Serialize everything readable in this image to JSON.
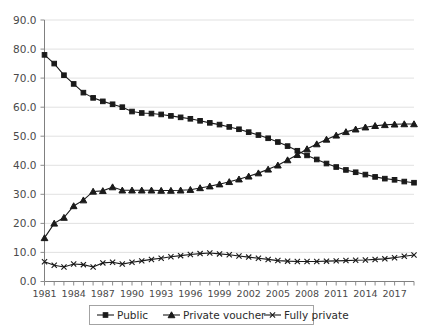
{
  "chart_data": {
    "type": "line",
    "title": "",
    "subtitle": "",
    "xlabel": "",
    "ylabel": "",
    "grid": "horizontal",
    "legend_position": "bottom-center",
    "xlim": [
      1981,
      2019
    ],
    "ylim": [
      0.0,
      90.0
    ],
    "ytick_step": 10.0,
    "xtick_step_labeled": 3,
    "x": [
      1981,
      1982,
      1983,
      1984,
      1985,
      1986,
      1987,
      1988,
      1989,
      1990,
      1991,
      1992,
      1993,
      1994,
      1995,
      1996,
      1997,
      1998,
      1999,
      2000,
      2001,
      2002,
      2003,
      2004,
      2005,
      2006,
      2007,
      2008,
      2009,
      2010,
      2011,
      2012,
      2013,
      2014,
      2015,
      2016,
      2017,
      2018,
      2019
    ],
    "xticklabels": [
      "1981",
      "1984",
      "1987",
      "1990",
      "1993",
      "1996",
      "1999",
      "2002",
      "2005",
      "2008",
      "2011",
      "2014",
      "2017"
    ],
    "yticklabels": [
      "0.0",
      "10.0",
      "20.0",
      "30.0",
      "40.0",
      "50.0",
      "60.0",
      "70.0",
      "80.0",
      "90.0"
    ],
    "series": [
      {
        "name": "Public",
        "marker": "square",
        "color": "#1a1a1a",
        "values": [
          78.0,
          75.0,
          71.0,
          68.0,
          65.0,
          63.2,
          62.0,
          61.0,
          60.0,
          58.5,
          58.0,
          57.8,
          57.5,
          57.0,
          56.5,
          56.0,
          55.3,
          54.6,
          54.0,
          53.2,
          52.4,
          51.4,
          50.4,
          49.3,
          48.0,
          46.6,
          45.0,
          43.4,
          42.0,
          40.6,
          39.4,
          38.4,
          37.6,
          36.8,
          36.0,
          35.4,
          35.0,
          34.4,
          34.0
        ]
      },
      {
        "name": "Private voucher",
        "marker": "triangle",
        "color": "#1a1a1a",
        "values": [
          15.0,
          20.0,
          22.0,
          26.0,
          28.0,
          31.0,
          31.2,
          32.5,
          31.4,
          31.4,
          31.4,
          31.4,
          31.3,
          31.3,
          31.4,
          31.6,
          32.2,
          32.8,
          33.5,
          34.3,
          35.2,
          36.2,
          37.3,
          38.6,
          40.0,
          41.8,
          43.6,
          45.6,
          47.3,
          48.9,
          50.3,
          51.5,
          52.4,
          53.1,
          53.6,
          53.9,
          54.1,
          54.2,
          54.2
        ]
      },
      {
        "name": "Fully private",
        "marker": "x",
        "color": "#1a1a1a",
        "values": [
          6.8,
          5.6,
          5.0,
          6.0,
          5.8,
          5.0,
          6.4,
          6.6,
          6.0,
          6.6,
          7.1,
          7.6,
          8.0,
          8.5,
          8.9,
          9.3,
          9.6,
          9.8,
          9.5,
          9.2,
          8.8,
          8.4,
          8.0,
          7.6,
          7.2,
          7.0,
          6.9,
          6.9,
          6.9,
          7.0,
          7.1,
          7.2,
          7.3,
          7.4,
          7.6,
          7.8,
          8.2,
          8.7,
          9.1
        ]
      }
    ],
    "legend": [
      {
        "label": "Public",
        "marker": "square"
      },
      {
        "label": "Private voucher",
        "marker": "triangle"
      },
      {
        "label": "Fully private",
        "marker": "x"
      }
    ]
  },
  "colors": {
    "background": "#ffffff",
    "ink": "#1a1a1a",
    "grid": "#d9d9d9",
    "axis": "#808080",
    "tick_label": "#4a4a4a"
  }
}
